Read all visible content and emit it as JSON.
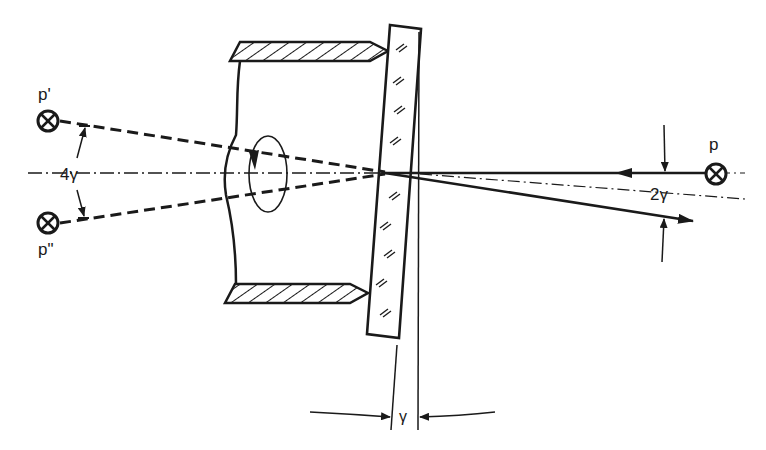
{
  "diagram": {
    "labels": {
      "source_p": "p",
      "image_p_prime": "p'",
      "image_p_double_prime": "p\"",
      "angle_4gamma": "4γ",
      "angle_2gamma": "2γ",
      "angle_gamma": "γ"
    },
    "colors": {
      "ink": "#1a1a1a",
      "background": "#ffffff"
    }
  }
}
